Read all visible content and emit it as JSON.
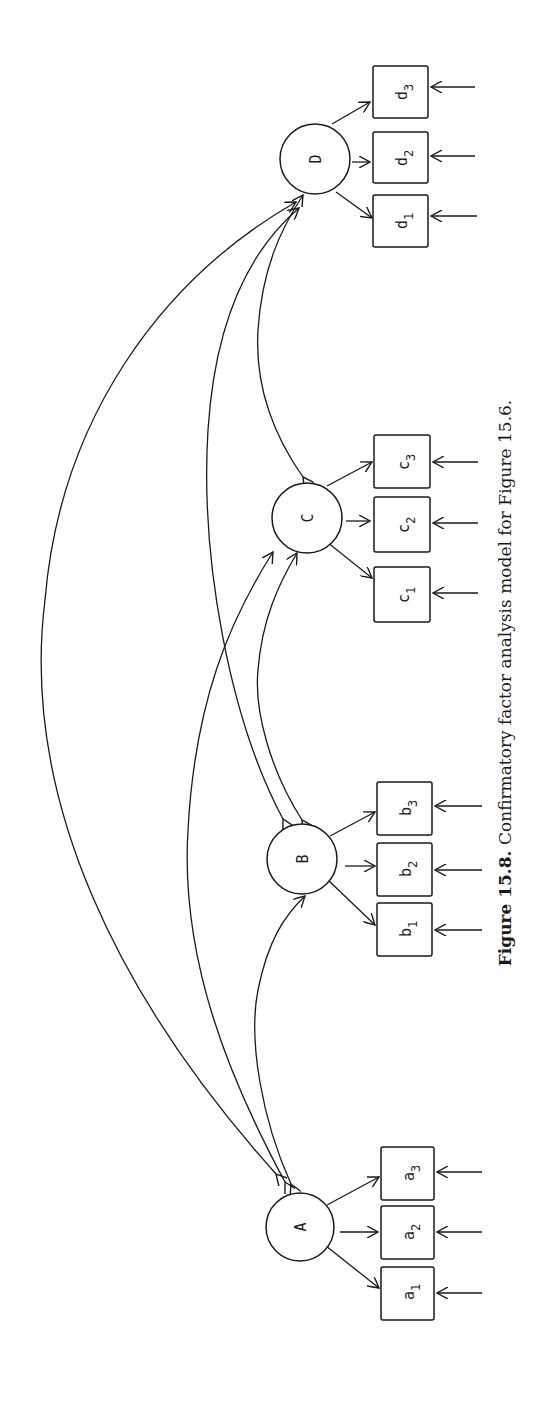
{
  "figure": {
    "caption_label": "Figure 15.8.",
    "caption_text": " Confirmatory factor analysis model for Figure 15.6.",
    "orientation": "rotated 90 degrees counter-clockwise"
  },
  "factors": [
    {
      "id": "A",
      "label": "A",
      "indicators": [
        {
          "base": "a",
          "sub": "1"
        },
        {
          "base": "a",
          "sub": "2"
        },
        {
          "base": "a",
          "sub": "3"
        }
      ]
    },
    {
      "id": "B",
      "label": "B",
      "indicators": [
        {
          "base": "b",
          "sub": "1"
        },
        {
          "base": "b",
          "sub": "2"
        },
        {
          "base": "b",
          "sub": "3"
        }
      ]
    },
    {
      "id": "C",
      "label": "C",
      "indicators": [
        {
          "base": "c",
          "sub": "1"
        },
        {
          "base": "c",
          "sub": "2"
        },
        {
          "base": "c",
          "sub": "3"
        }
      ]
    },
    {
      "id": "D",
      "label": "D",
      "indicators": [
        {
          "base": "d",
          "sub": "1"
        },
        {
          "base": "d",
          "sub": "2"
        },
        {
          "base": "d",
          "sub": "3"
        }
      ]
    }
  ],
  "covariances": [
    {
      "from": "A",
      "to": "B"
    },
    {
      "from": "A",
      "to": "C"
    },
    {
      "from": "A",
      "to": "D"
    },
    {
      "from": "B",
      "to": "C"
    },
    {
      "from": "B",
      "to": "D"
    },
    {
      "from": "C",
      "to": "D"
    }
  ],
  "error_arrows_per_indicator": 1
}
